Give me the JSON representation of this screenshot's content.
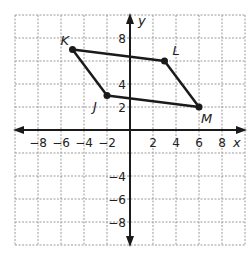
{
  "chart_data": {
    "type": "scatter",
    "title": "",
    "xlabel": "x",
    "ylabel": "y",
    "xlim": [
      -10,
      10
    ],
    "ylim": [
      -10,
      10
    ],
    "grid": true,
    "x_ticks": [
      {
        "value": -8,
        "label": "−8"
      },
      {
        "value": -6,
        "label": "−6"
      },
      {
        "value": -4,
        "label": "−4"
      },
      {
        "value": -2,
        "label": "−2"
      },
      {
        "value": 2,
        "label": "2"
      },
      {
        "value": 4,
        "label": "4"
      },
      {
        "value": 6,
        "label": "6"
      },
      {
        "value": 8,
        "label": "8"
      }
    ],
    "y_ticks": [
      {
        "value": 8,
        "label": "8"
      },
      {
        "value": 4,
        "label": "4"
      },
      {
        "value": 2,
        "label": "2"
      },
      {
        "value": -4,
        "label": "−4"
      },
      {
        "value": -6,
        "label": "−6"
      },
      {
        "value": -8,
        "label": "−8"
      }
    ],
    "points": [
      {
        "name": "K",
        "x": -5,
        "y": 7,
        "label_pos": "upper-left"
      },
      {
        "name": "L",
        "x": 3,
        "y": 6,
        "label_pos": "upper-right"
      },
      {
        "name": "M",
        "x": 6,
        "y": 2,
        "label_pos": "lower-right"
      },
      {
        "name": "J",
        "x": -2,
        "y": 3,
        "label_pos": "lower-left"
      }
    ],
    "polygon": [
      "K",
      "L",
      "M",
      "J"
    ],
    "colors": {
      "line": "#1a1a1a",
      "grid": "#9a9a9a",
      "axis": "#1a1a1a"
    }
  }
}
